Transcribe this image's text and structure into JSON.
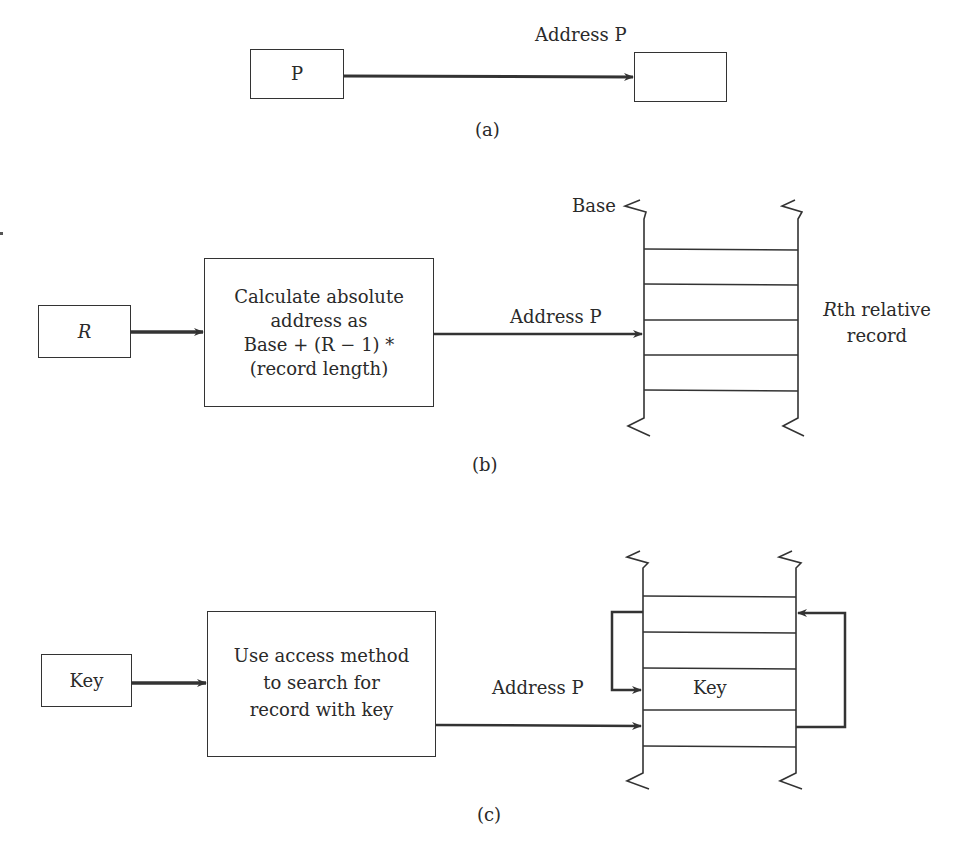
{
  "figure": {
    "part_a": {
      "caption": "(a)",
      "source_box_label": "P",
      "arrow_label": "Address P",
      "target_box_label": ""
    },
    "part_b": {
      "caption": "(b)",
      "input_box_label": "R",
      "process_box_lines": [
        "Calculate absolute",
        "address as",
        "Base + (R − 1) *",
        "(record length)"
      ],
      "arrow_label": "Address P",
      "file_base_label": "Base",
      "file_side_label_lines": [
        "Rth relative",
        "record"
      ],
      "record_count": 4
    },
    "part_c": {
      "caption": "(c)",
      "input_box_label": "Key",
      "process_box_lines": [
        "Use access method",
        "to search for",
        "record with key"
      ],
      "arrow_label": "Address P",
      "found_record_label": "Key",
      "record_count": 4
    }
  },
  "colors": {
    "line": "#333333",
    "text": "#2a2a2a",
    "background": "#ffffff"
  }
}
